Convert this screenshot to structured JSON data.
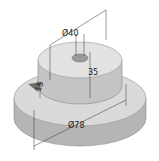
{
  "figure": {
    "type": "isometric technical drawing",
    "part": "stepped cylindrical disc with top boss, center hole and side notch",
    "dimensions": {
      "hole_diameter": "Ø10",
      "boss_diameter": "Ø40",
      "boss_height": "35",
      "notch_height": "15",
      "base_diameter": "Ø78"
    },
    "colors": {
      "top_face": "#dcdcdc",
      "side_face": "#b9b9b9",
      "dark_side": "#a8a8a8",
      "lines": "#333333"
    }
  }
}
